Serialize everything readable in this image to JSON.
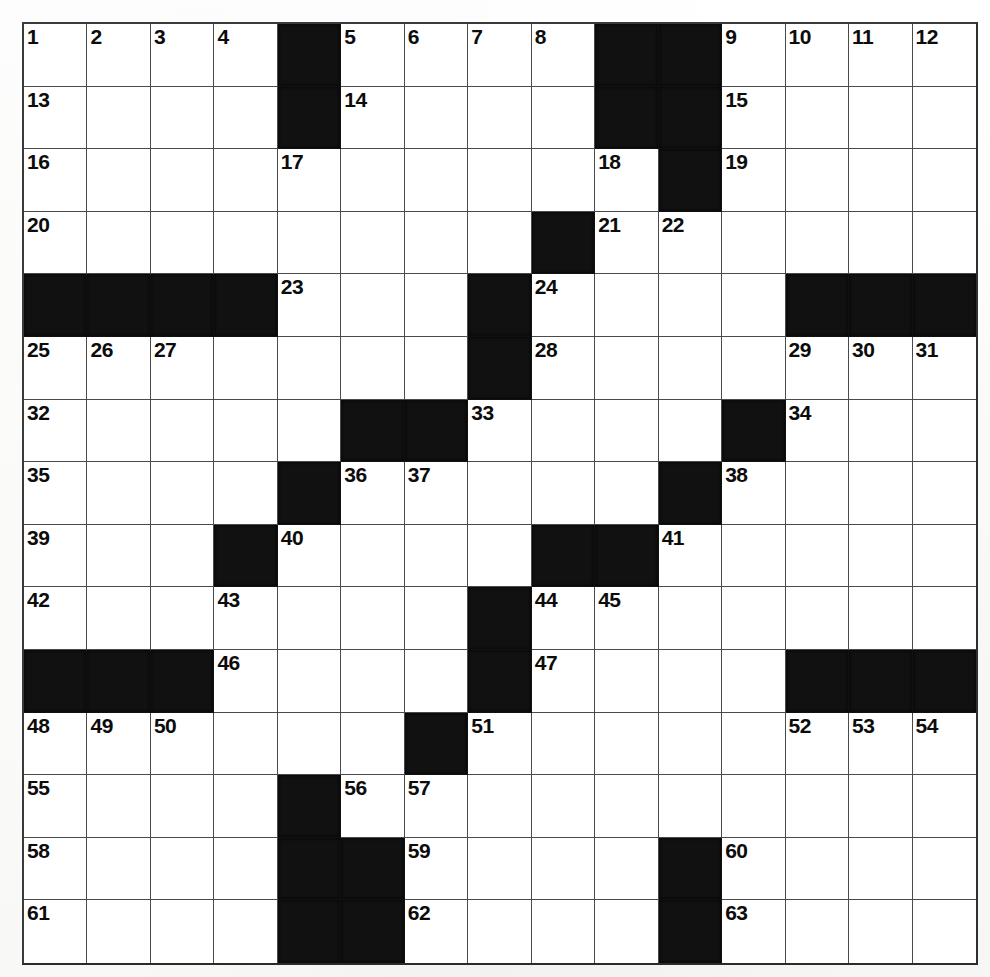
{
  "puzzle": {
    "type": "crossword-grid",
    "title": "",
    "rows": 15,
    "columns": 15,
    "colors": {
      "block": "#111111",
      "cell": "#ffffff",
      "grid_line": "#4a4a4a",
      "border": "#2f2f2f",
      "number": "#0c0c0c",
      "paper": "#fdfdfb"
    },
    "highest_number": 63,
    "grid": [
      [
        {
          "block": false,
          "num": "1"
        },
        {
          "block": false,
          "num": "2"
        },
        {
          "block": false,
          "num": "3"
        },
        {
          "block": false,
          "num": "4"
        },
        {
          "block": true,
          "num": ""
        },
        {
          "block": false,
          "num": "5"
        },
        {
          "block": false,
          "num": "6"
        },
        {
          "block": false,
          "num": "7"
        },
        {
          "block": false,
          "num": "8"
        },
        {
          "block": true,
          "num": ""
        },
        {
          "block": true,
          "num": ""
        },
        {
          "block": false,
          "num": "9"
        },
        {
          "block": false,
          "num": "10"
        },
        {
          "block": false,
          "num": "11"
        },
        {
          "block": false,
          "num": "12"
        }
      ],
      [
        {
          "block": false,
          "num": "13"
        },
        {
          "block": false,
          "num": ""
        },
        {
          "block": false,
          "num": ""
        },
        {
          "block": false,
          "num": ""
        },
        {
          "block": true,
          "num": ""
        },
        {
          "block": false,
          "num": "14"
        },
        {
          "block": false,
          "num": ""
        },
        {
          "block": false,
          "num": ""
        },
        {
          "block": false,
          "num": ""
        },
        {
          "block": true,
          "num": ""
        },
        {
          "block": true,
          "num": ""
        },
        {
          "block": false,
          "num": "15"
        },
        {
          "block": false,
          "num": ""
        },
        {
          "block": false,
          "num": ""
        },
        {
          "block": false,
          "num": ""
        }
      ],
      [
        {
          "block": false,
          "num": "16"
        },
        {
          "block": false,
          "num": ""
        },
        {
          "block": false,
          "num": ""
        },
        {
          "block": false,
          "num": ""
        },
        {
          "block": false,
          "num": "17"
        },
        {
          "block": false,
          "num": ""
        },
        {
          "block": false,
          "num": ""
        },
        {
          "block": false,
          "num": ""
        },
        {
          "block": false,
          "num": ""
        },
        {
          "block": false,
          "num": "18"
        },
        {
          "block": true,
          "num": ""
        },
        {
          "block": false,
          "num": "19"
        },
        {
          "block": false,
          "num": ""
        },
        {
          "block": false,
          "num": ""
        },
        {
          "block": false,
          "num": ""
        }
      ],
      [
        {
          "block": false,
          "num": "20"
        },
        {
          "block": false,
          "num": ""
        },
        {
          "block": false,
          "num": ""
        },
        {
          "block": false,
          "num": ""
        },
        {
          "block": false,
          "num": ""
        },
        {
          "block": false,
          "num": ""
        },
        {
          "block": false,
          "num": ""
        },
        {
          "block": false,
          "num": ""
        },
        {
          "block": true,
          "num": ""
        },
        {
          "block": false,
          "num": "21"
        },
        {
          "block": false,
          "num": "22"
        },
        {
          "block": false,
          "num": ""
        },
        {
          "block": false,
          "num": ""
        },
        {
          "block": false,
          "num": ""
        },
        {
          "block": false,
          "num": ""
        }
      ],
      [
        {
          "block": true,
          "num": ""
        },
        {
          "block": true,
          "num": ""
        },
        {
          "block": true,
          "num": ""
        },
        {
          "block": true,
          "num": ""
        },
        {
          "block": false,
          "num": "23"
        },
        {
          "block": false,
          "num": ""
        },
        {
          "block": false,
          "num": ""
        },
        {
          "block": true,
          "num": ""
        },
        {
          "block": false,
          "num": "24"
        },
        {
          "block": false,
          "num": ""
        },
        {
          "block": false,
          "num": ""
        },
        {
          "block": false,
          "num": ""
        },
        {
          "block": true,
          "num": ""
        },
        {
          "block": true,
          "num": ""
        },
        {
          "block": true,
          "num": ""
        }
      ],
      [
        {
          "block": false,
          "num": "25"
        },
        {
          "block": false,
          "num": "26"
        },
        {
          "block": false,
          "num": "27"
        },
        {
          "block": false,
          "num": ""
        },
        {
          "block": false,
          "num": ""
        },
        {
          "block": false,
          "num": ""
        },
        {
          "block": false,
          "num": ""
        },
        {
          "block": true,
          "num": ""
        },
        {
          "block": false,
          "num": "28"
        },
        {
          "block": false,
          "num": ""
        },
        {
          "block": false,
          "num": ""
        },
        {
          "block": false,
          "num": ""
        },
        {
          "block": false,
          "num": "29"
        },
        {
          "block": false,
          "num": "30"
        },
        {
          "block": false,
          "num": "31"
        }
      ],
      [
        {
          "block": false,
          "num": "32"
        },
        {
          "block": false,
          "num": ""
        },
        {
          "block": false,
          "num": ""
        },
        {
          "block": false,
          "num": ""
        },
        {
          "block": false,
          "num": ""
        },
        {
          "block": true,
          "num": ""
        },
        {
          "block": true,
          "num": ""
        },
        {
          "block": false,
          "num": "33"
        },
        {
          "block": false,
          "num": ""
        },
        {
          "block": false,
          "num": ""
        },
        {
          "block": false,
          "num": ""
        },
        {
          "block": true,
          "num": ""
        },
        {
          "block": false,
          "num": "34"
        },
        {
          "block": false,
          "num": ""
        },
        {
          "block": false,
          "num": ""
        }
      ],
      [
        {
          "block": false,
          "num": "35"
        },
        {
          "block": false,
          "num": ""
        },
        {
          "block": false,
          "num": ""
        },
        {
          "block": false,
          "num": ""
        },
        {
          "block": true,
          "num": ""
        },
        {
          "block": false,
          "num": "36"
        },
        {
          "block": false,
          "num": "37"
        },
        {
          "block": false,
          "num": ""
        },
        {
          "block": false,
          "num": ""
        },
        {
          "block": false,
          "num": ""
        },
        {
          "block": true,
          "num": ""
        },
        {
          "block": false,
          "num": "38"
        },
        {
          "block": false,
          "num": ""
        },
        {
          "block": false,
          "num": ""
        },
        {
          "block": false,
          "num": ""
        }
      ],
      [
        {
          "block": false,
          "num": "39"
        },
        {
          "block": false,
          "num": ""
        },
        {
          "block": false,
          "num": ""
        },
        {
          "block": true,
          "num": ""
        },
        {
          "block": false,
          "num": "40"
        },
        {
          "block": false,
          "num": ""
        },
        {
          "block": false,
          "num": ""
        },
        {
          "block": false,
          "num": ""
        },
        {
          "block": true,
          "num": ""
        },
        {
          "block": true,
          "num": ""
        },
        {
          "block": false,
          "num": "41"
        },
        {
          "block": false,
          "num": ""
        },
        {
          "block": false,
          "num": ""
        },
        {
          "block": false,
          "num": ""
        },
        {
          "block": false,
          "num": ""
        }
      ],
      [
        {
          "block": false,
          "num": "42"
        },
        {
          "block": false,
          "num": ""
        },
        {
          "block": false,
          "num": ""
        },
        {
          "block": false,
          "num": "43"
        },
        {
          "block": false,
          "num": ""
        },
        {
          "block": false,
          "num": ""
        },
        {
          "block": false,
          "num": ""
        },
        {
          "block": true,
          "num": ""
        },
        {
          "block": false,
          "num": "44"
        },
        {
          "block": false,
          "num": "45"
        },
        {
          "block": false,
          "num": ""
        },
        {
          "block": false,
          "num": ""
        },
        {
          "block": false,
          "num": ""
        },
        {
          "block": false,
          "num": ""
        },
        {
          "block": false,
          "num": ""
        }
      ],
      [
        {
          "block": true,
          "num": ""
        },
        {
          "block": true,
          "num": ""
        },
        {
          "block": true,
          "num": ""
        },
        {
          "block": false,
          "num": "46"
        },
        {
          "block": false,
          "num": ""
        },
        {
          "block": false,
          "num": ""
        },
        {
          "block": false,
          "num": ""
        },
        {
          "block": true,
          "num": ""
        },
        {
          "block": false,
          "num": "47"
        },
        {
          "block": false,
          "num": ""
        },
        {
          "block": false,
          "num": ""
        },
        {
          "block": false,
          "num": ""
        },
        {
          "block": true,
          "num": ""
        },
        {
          "block": true,
          "num": ""
        },
        {
          "block": true,
          "num": ""
        }
      ],
      [
        {
          "block": false,
          "num": "48"
        },
        {
          "block": false,
          "num": "49"
        },
        {
          "block": false,
          "num": "50"
        },
        {
          "block": false,
          "num": ""
        },
        {
          "block": false,
          "num": ""
        },
        {
          "block": false,
          "num": ""
        },
        {
          "block": true,
          "num": ""
        },
        {
          "block": false,
          "num": "51"
        },
        {
          "block": false,
          "num": ""
        },
        {
          "block": false,
          "num": ""
        },
        {
          "block": false,
          "num": ""
        },
        {
          "block": false,
          "num": ""
        },
        {
          "block": false,
          "num": "52"
        },
        {
          "block": false,
          "num": "53"
        },
        {
          "block": false,
          "num": "54"
        }
      ],
      [
        {
          "block": false,
          "num": "55"
        },
        {
          "block": false,
          "num": ""
        },
        {
          "block": false,
          "num": ""
        },
        {
          "block": false,
          "num": ""
        },
        {
          "block": true,
          "num": ""
        },
        {
          "block": false,
          "num": "56"
        },
        {
          "block": false,
          "num": "57"
        },
        {
          "block": false,
          "num": ""
        },
        {
          "block": false,
          "num": ""
        },
        {
          "block": false,
          "num": ""
        },
        {
          "block": false,
          "num": ""
        },
        {
          "block": false,
          "num": ""
        },
        {
          "block": false,
          "num": ""
        },
        {
          "block": false,
          "num": ""
        },
        {
          "block": false,
          "num": ""
        }
      ],
      [
        {
          "block": false,
          "num": "58"
        },
        {
          "block": false,
          "num": ""
        },
        {
          "block": false,
          "num": ""
        },
        {
          "block": false,
          "num": ""
        },
        {
          "block": true,
          "num": ""
        },
        {
          "block": true,
          "num": ""
        },
        {
          "block": false,
          "num": "59"
        },
        {
          "block": false,
          "num": ""
        },
        {
          "block": false,
          "num": ""
        },
        {
          "block": false,
          "num": ""
        },
        {
          "block": true,
          "num": ""
        },
        {
          "block": false,
          "num": "60"
        },
        {
          "block": false,
          "num": ""
        },
        {
          "block": false,
          "num": ""
        },
        {
          "block": false,
          "num": ""
        }
      ],
      [
        {
          "block": false,
          "num": "61"
        },
        {
          "block": false,
          "num": ""
        },
        {
          "block": false,
          "num": ""
        },
        {
          "block": false,
          "num": ""
        },
        {
          "block": true,
          "num": ""
        },
        {
          "block": true,
          "num": ""
        },
        {
          "block": false,
          "num": "62"
        },
        {
          "block": false,
          "num": ""
        },
        {
          "block": false,
          "num": ""
        },
        {
          "block": false,
          "num": ""
        },
        {
          "block": true,
          "num": ""
        },
        {
          "block": false,
          "num": "63"
        },
        {
          "block": false,
          "num": ""
        },
        {
          "block": false,
          "num": ""
        },
        {
          "block": false,
          "num": ""
        }
      ]
    ]
  }
}
